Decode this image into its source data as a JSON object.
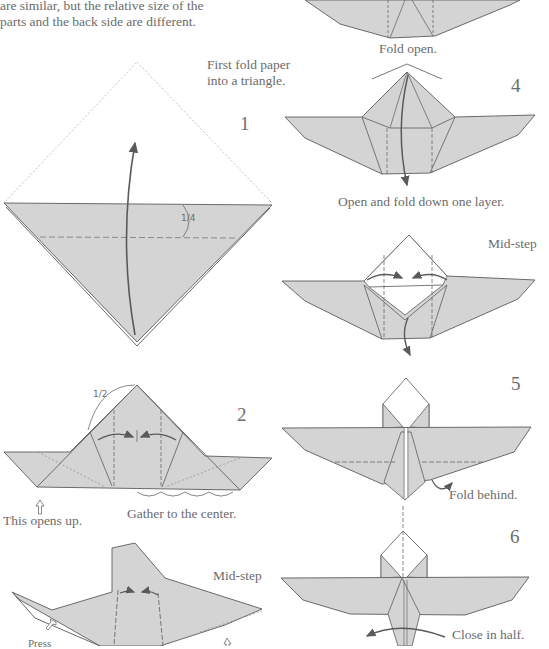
{
  "intro": {
    "line1": "are similar, but the relative size of the",
    "line2": "parts and the back side are different."
  },
  "colors": {
    "paper_fill": "#d4d4d4",
    "line": "#6a6a6a",
    "text": "#6b6b6b",
    "background": "#ffffff"
  },
  "steps": [
    {
      "number": "1",
      "caption_line1": "First fold paper",
      "caption_line2": "into a triangle.",
      "measure": "1/4"
    },
    {
      "number": "2",
      "measure": "1/2",
      "caption_left": "This opens up.",
      "caption_right": "Gather to the center."
    },
    {
      "number": "",
      "caption": "Mid-step",
      "caption_press": "Press"
    },
    {
      "number": "",
      "caption": "Fold open."
    },
    {
      "number": "4",
      "caption": "Open and fold down one layer."
    },
    {
      "number": "",
      "caption": "Mid-step"
    },
    {
      "number": "5",
      "caption": "Fold behind."
    },
    {
      "number": "6",
      "caption": "Close in half."
    }
  ]
}
